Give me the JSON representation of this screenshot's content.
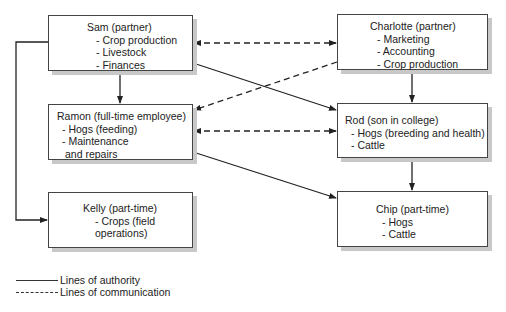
{
  "nodes": {
    "sam": {
      "title": "Sam (partner)",
      "items": [
        "- Crop production",
        "- Livestock",
        "- Finances"
      ]
    },
    "charlotte": {
      "title": "Charlotte (partner)",
      "items": [
        "- Marketing",
        "- Accounting",
        "- Crop production"
      ]
    },
    "ramon": {
      "title": "Ramon (full-time employee)",
      "items": [
        "- Hogs (feeding)",
        "- Maintenance",
        "  and repairs"
      ]
    },
    "rod": {
      "title": "Rod (son in college)",
      "items": [
        "- Hogs (breeding and health)",
        "- Cattle"
      ]
    },
    "kelly": {
      "title": "Kelly (part-time)",
      "items": [
        "- Crops (field",
        "operations)"
      ]
    },
    "chip": {
      "title": "Chip (part-time)",
      "items": [
        "- Hogs",
        "- Cattle"
      ]
    }
  },
  "edges": [
    {
      "from": "Sam",
      "to": "Ramon",
      "type": "authority"
    },
    {
      "from": "Sam",
      "to": "Rod",
      "type": "authority"
    },
    {
      "from": "Sam",
      "to": "Kelly",
      "type": "authority"
    },
    {
      "from": "Charlotte",
      "to": "Rod",
      "type": "authority"
    },
    {
      "from": "Ramon",
      "to": "Chip",
      "type": "authority"
    },
    {
      "from": "Rod",
      "to": "Chip",
      "type": "authority"
    },
    {
      "from": "Sam",
      "to": "Charlotte",
      "type": "communication",
      "bidirectional": true
    },
    {
      "from": "Charlotte",
      "to": "Ramon",
      "type": "communication"
    },
    {
      "from": "Ramon",
      "to": "Rod",
      "type": "communication",
      "bidirectional": true
    }
  ],
  "legend": {
    "authority": "Lines of authority",
    "communication": "Lines of communication"
  }
}
